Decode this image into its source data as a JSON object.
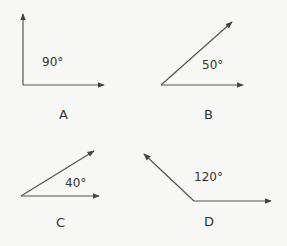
{
  "figures": [
    {
      "letter": "A",
      "angle_label": "90°",
      "angle": 90
    },
    {
      "letter": "B",
      "angle_label": "50°",
      "angle": 50
    },
    {
      "letter": "C",
      "angle_label": "40°",
      "angle": 40
    },
    {
      "letter": "D",
      "angle_label": "120°",
      "angle": 120
    }
  ],
  "colors": {
    "line": "#444444",
    "background": "#f7f7f6"
  }
}
